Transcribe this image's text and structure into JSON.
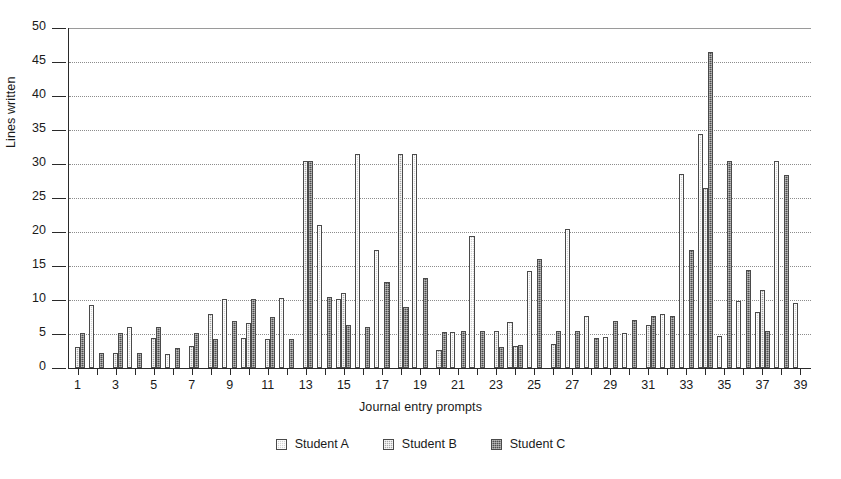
{
  "chart_data": {
    "type": "bar",
    "title": "",
    "xlabel": "Journal entry prompts",
    "ylabel": "Lines written",
    "ylim": [
      0,
      50
    ],
    "ytick_labels": [
      "0",
      "5",
      "10",
      "15",
      "20",
      "25",
      "30",
      "35",
      "40",
      "45",
      "50"
    ],
    "ytick_values": [
      0,
      5,
      10,
      15,
      20,
      25,
      30,
      35,
      40,
      45,
      50
    ],
    "grid": "horizontal-dotted",
    "legend_position": "bottom-center",
    "categories": [
      1,
      2,
      3,
      4,
      5,
      6,
      7,
      8,
      9,
      10,
      11,
      12,
      13,
      14,
      15,
      16,
      17,
      18,
      19,
      20,
      21,
      22,
      23,
      24,
      25,
      26,
      27,
      28,
      29,
      30,
      31,
      32,
      33,
      34,
      35,
      36,
      37,
      38,
      39
    ],
    "xtick_labels": [
      "1",
      "3",
      "5",
      "7",
      "9",
      "11",
      "13",
      "15",
      "17",
      "19",
      "21",
      "23",
      "25",
      "27",
      "29",
      "31",
      "33",
      "35",
      "37",
      "39"
    ],
    "series": [
      {
        "name": "Student A",
        "color": "#d2d2d2",
        "values": [
          0,
          9.3,
          0,
          6,
          0,
          2.1,
          0,
          0,
          10.2,
          4.4,
          0,
          10.3,
          0,
          21,
          10.2,
          31.4,
          17.3,
          0,
          31.4,
          0,
          5.3,
          19.4,
          0,
          6.8,
          14.2,
          0,
          20.4,
          7.7,
          4.6,
          5.2,
          0,
          8,
          28.5,
          34.4,
          4.7,
          9.9,
          8.3,
          30.5,
          9.6
        ]
      },
      {
        "name": "Student B",
        "color": "#a8a8a8",
        "values": [
          3.1,
          0,
          2.2,
          0,
          4.4,
          0,
          3.2,
          8,
          0,
          6.6,
          4.3,
          0,
          30.4,
          0,
          11,
          0,
          0,
          31.4,
          0,
          2.6,
          0,
          0,
          5.5,
          3.3,
          0,
          3.5,
          0,
          0,
          0,
          0,
          6.3,
          0,
          0,
          26.4,
          0,
          0,
          11.4,
          0,
          0
        ]
      },
      {
        "name": "Student C",
        "color": "#4e4e4e",
        "values": [
          5.1,
          2.2,
          5.1,
          2.2,
          6.1,
          3,
          5.1,
          4.3,
          6.9,
          10.1,
          7.5,
          4.3,
          30.4,
          10.5,
          6.3,
          6.1,
          12.6,
          9,
          13.3,
          5.3,
          5.4,
          5.5,
          3.1,
          3.4,
          16,
          5.4,
          5.4,
          4.4,
          6.9,
          7,
          7.7,
          7.7,
          17.4,
          46.4,
          30.4,
          14.4,
          5.5,
          28.4,
          0
        ]
      }
    ]
  },
  "legend": {
    "items": [
      {
        "label": "Student A"
      },
      {
        "label": "Student B"
      },
      {
        "label": "Student C"
      }
    ]
  }
}
